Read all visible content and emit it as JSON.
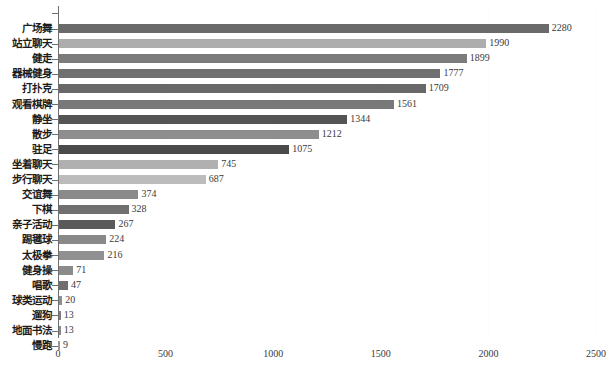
{
  "chart_data": {
    "type": "bar",
    "orientation": "horizontal",
    "title": "",
    "xlabel": "",
    "ylabel": "",
    "xlim": [
      0,
      2500
    ],
    "xticks": [
      0,
      500,
      1000,
      1500,
      2000,
      2500
    ],
    "xtick_labels": [
      "0",
      "500",
      "1000",
      "1500",
      "2000",
      "2500"
    ],
    "grid": true,
    "grid_axis": "x",
    "legend": false,
    "categories": [
      "广场舞",
      "站立聊天",
      "健走",
      "器械健身",
      "打扑克",
      "观看棋牌",
      "静坐",
      "散步",
      "驻足",
      "坐着聊天",
      "步行聊天",
      "交谊舞",
      "下棋",
      "亲子活动",
      "踢毽球",
      "太极拳",
      "健身操",
      "唱歌",
      "球类运动",
      "遛狗",
      "地面书法",
      "慢跑"
    ],
    "values": [
      2280,
      1990,
      1899,
      1777,
      1709,
      1561,
      1344,
      1212,
      1075,
      745,
      687,
      374,
      328,
      267,
      224,
      216,
      71,
      47,
      20,
      13,
      13,
      9
    ],
    "value_labels": [
      "2280",
      "1990",
      "1899",
      "1777",
      "1709",
      "1561",
      "1344",
      "1212",
      "1075",
      "745",
      "687",
      "374",
      "328",
      "267",
      "224",
      "216",
      "71",
      "47",
      "20",
      "13",
      "13",
      "9"
    ],
    "bar_colors": [
      "#6a6a6a",
      "#adadad",
      "#7c7c7c",
      "#707070",
      "#686868",
      "#787878",
      "#545454",
      "#8e8e8e",
      "#4a4a4a",
      "#b0b0b0",
      "#bcbcbc",
      "#8a8a8a",
      "#707070",
      "#5a5a5a",
      "#898989",
      "#909090",
      "#8b8b8b",
      "#6f6f6f",
      "#8f8f8f",
      "#7e7e7e",
      "#8a8a8a",
      "#9a9a9a"
    ]
  },
  "axis": {
    "axis_line_color": "#6e6e6e",
    "gridline_color": "#fdfdfd"
  }
}
